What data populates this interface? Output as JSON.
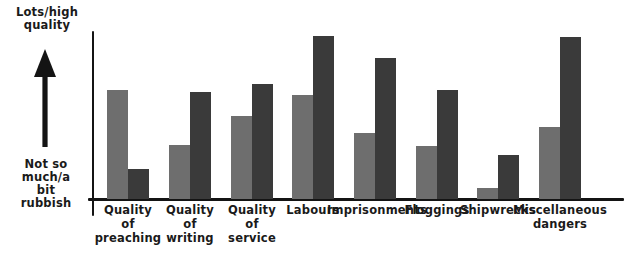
{
  "chart_data": {
    "type": "bar",
    "title": "",
    "xlabel": "",
    "ylabel": "",
    "grid": false,
    "legend_position": "none",
    "y_axis_top_label": "Lots/high quality",
    "y_axis_bottom_label": "Not so much/a bit rubbish",
    "ylim": [
      0,
      100
    ],
    "categories": [
      "Quality of preaching",
      "Quality of writing",
      "Quality of service",
      "Labours",
      "Imprisonments",
      "Floggings",
      "Shipwrecks",
      "Miscellaneous dangers"
    ],
    "series": [
      {
        "name": "series-a",
        "color": "#6e6e6e",
        "values": [
          65,
          32,
          49,
          62,
          39,
          31,
          6,
          43
        ]
      },
      {
        "name": "series-b",
        "color": "#3a3a3a",
        "values": [
          18,
          64,
          68,
          97,
          84,
          65,
          26,
          96
        ]
      }
    ]
  },
  "axis": {
    "top_label_lines": [
      "Lots/high",
      "quality"
    ],
    "bottom_label_lines": [
      "Not so",
      "much/a",
      "bit",
      "rubbish"
    ],
    "arrow_icon": "up-arrow-icon"
  },
  "category_labels": [
    {
      "lines": [
        "Quality",
        "of",
        "preaching"
      ]
    },
    {
      "lines": [
        "Quality",
        "of",
        "writing"
      ]
    },
    {
      "lines": [
        "Quality",
        "of",
        "service"
      ]
    },
    {
      "lines": [
        "Labours"
      ]
    },
    {
      "lines": [
        "Imprisonments"
      ]
    },
    {
      "lines": [
        "Floggings"
      ]
    },
    {
      "lines": [
        "Shipwrecks"
      ]
    },
    {
      "lines": [
        "Miscellaneous",
        "dangers"
      ]
    }
  ],
  "layout": {
    "baseline_y": 199,
    "plot_top_y": 30,
    "group_centers_x": [
      128,
      190,
      252,
      313,
      375,
      437,
      498,
      560
    ],
    "bar_width": 21,
    "bar_tops_series_a": [
      90,
      145,
      116,
      95,
      133,
      146,
      188,
      127
    ],
    "bar_tops_series_b": [
      169,
      92,
      84,
      36,
      58,
      90,
      155,
      37
    ]
  },
  "colors": {
    "series_a": "#6e6e6e",
    "series_b": "#3a3a3a",
    "axis": "#141414",
    "text": "#1a1a1a",
    "background": "#ffffff"
  }
}
